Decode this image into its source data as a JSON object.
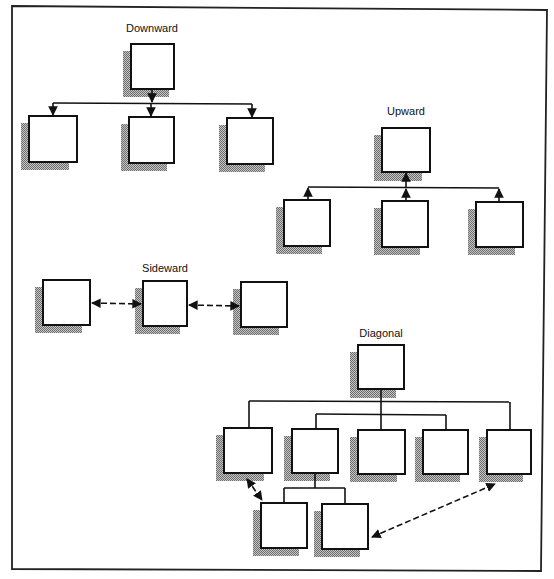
{
  "diagram": {
    "type": "communication-flow-organization-charts",
    "colors": {
      "ink": "#111111",
      "shadow": "#9a9a9a",
      "background": "#ffffff"
    },
    "panels": [
      {
        "id": "downward",
        "title": "Downward",
        "structure": "hierarchy",
        "nodes": [
          "top",
          "child-1",
          "child-2",
          "child-3"
        ],
        "edges": [
          {
            "from": "top",
            "to": "child-1",
            "style": "solid",
            "arrow": "to"
          },
          {
            "from": "top",
            "to": "child-2",
            "style": "solid",
            "arrow": "to"
          },
          {
            "from": "top",
            "to": "child-3",
            "style": "solid",
            "arrow": "to"
          }
        ]
      },
      {
        "id": "upward",
        "title": "Upward",
        "structure": "hierarchy",
        "nodes": [
          "top",
          "child-1",
          "child-2",
          "child-3"
        ],
        "edges": [
          {
            "from": "child-1",
            "to": "top",
            "style": "solid",
            "arrow": "to"
          },
          {
            "from": "child-2",
            "to": "top",
            "style": "solid",
            "arrow": "to"
          },
          {
            "from": "child-3",
            "to": "top",
            "style": "solid",
            "arrow": "to"
          }
        ]
      },
      {
        "id": "sideward",
        "title": "Sideward",
        "structure": "peers",
        "nodes": [
          "left",
          "middle",
          "right"
        ],
        "edges": [
          {
            "from": "left",
            "to": "middle",
            "style": "dashed",
            "arrow": "both"
          },
          {
            "from": "middle",
            "to": "right",
            "style": "dashed",
            "arrow": "both"
          }
        ]
      },
      {
        "id": "diagonal",
        "title": "Diagonal",
        "structure": "hierarchy",
        "nodes": [
          "top",
          "level2-1",
          "level2-2",
          "level2-3",
          "level2-4",
          "level2-5",
          "level3-1",
          "level3-2"
        ],
        "edges": [
          {
            "from": "top",
            "to": "level2-1",
            "style": "solid",
            "arrow": "none"
          },
          {
            "from": "top",
            "to": "level2-2",
            "style": "solid",
            "arrow": "none"
          },
          {
            "from": "top",
            "to": "level2-3",
            "style": "solid",
            "arrow": "none"
          },
          {
            "from": "top",
            "to": "level2-4",
            "style": "solid",
            "arrow": "none"
          },
          {
            "from": "top",
            "to": "level2-5",
            "style": "solid",
            "arrow": "none"
          },
          {
            "from": "level2-2",
            "to": "level3-1",
            "style": "solid",
            "arrow": "none"
          },
          {
            "from": "level2-2",
            "to": "level3-2",
            "style": "solid",
            "arrow": "none"
          },
          {
            "from": "level2-1",
            "to": "level3-1",
            "style": "dashed",
            "arrow": "both"
          },
          {
            "from": "level3-2",
            "to": "level2-5",
            "style": "dashed",
            "arrow": "both"
          }
        ]
      }
    ]
  }
}
